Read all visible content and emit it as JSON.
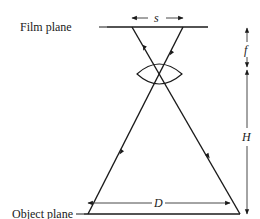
{
  "labels": {
    "film_plane": "Film plane",
    "object_plane": "Object plane",
    "s": "s",
    "f": "f",
    "H": "H",
    "D": "D"
  },
  "colors": {
    "line": "#1a1a1a",
    "dim": "#333333"
  },
  "geometry": {
    "film_plane": {
      "x1": 107,
      "x2": 208,
      "y": 27
    },
    "object_plane": {
      "x1": 75,
      "x2": 240,
      "y": 214
    },
    "lens_center": {
      "x": 159,
      "y": 73
    },
    "rays": [
      {
        "from": [
          88,
          214
        ],
        "to": [
          183,
          27
        ]
      },
      {
        "from": [
          240,
          214
        ],
        "to": [
          132,
          27
        ]
      }
    ]
  }
}
